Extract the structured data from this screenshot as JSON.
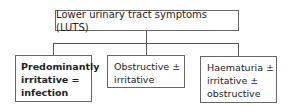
{
  "diagram": {
    "root": {
      "label": "Lower urinary tract symptoms (LUTS)"
    },
    "children": [
      {
        "lines": [
          "Predominantly",
          "irritative =",
          "infection"
        ],
        "emphasis": "bold"
      },
      {
        "lines": [
          "Obstructive ±",
          "irritative"
        ]
      },
      {
        "lines": [
          "Haematuria ±",
          "irritative ±",
          "obstructive"
        ]
      }
    ]
  }
}
